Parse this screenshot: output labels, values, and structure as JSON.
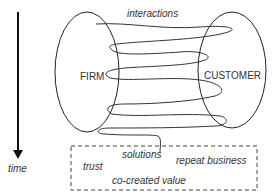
{
  "diagram": {
    "entities": {
      "firm": "FIRM",
      "customer": "CUSTOMER"
    },
    "interactions_label": "interactions",
    "time_label": "time",
    "outcomes": {
      "trust": "trust",
      "solutions": "solutions",
      "repeat_business": "repeat business",
      "co_created_value": "co-created value"
    }
  }
}
